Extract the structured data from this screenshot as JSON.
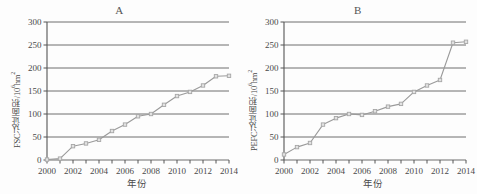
{
  "figure": {
    "panel_a_letter": "A",
    "panel_b_letter": "B",
    "line_color": "#9a9a9a",
    "marker_color": "#a6a6a6",
    "axis_color": "#555555",
    "gridline_color": "#6e6e6e",
    "background": "#fdfdfd"
  },
  "chart_data": [
    {
      "type": "line",
      "title": "A",
      "xlabel": "年份",
      "ylabel": "FSC认证面积/10⁶hm²",
      "ylabel_main": "FSC认证面积/10",
      "ylabel_exp": "6",
      "ylabel_unit": "hm",
      "ylabel_unit_exp": "2",
      "x": [
        2000,
        2001,
        2002,
        2003,
        2004,
        2005,
        2006,
        2007,
        2008,
        2009,
        2010,
        2011,
        2012,
        2013,
        2014
      ],
      "values": [
        1,
        3,
        30,
        36,
        44,
        63,
        77,
        95,
        100,
        120,
        139,
        148,
        162,
        182,
        183
      ],
      "xticklabels": [
        "2000",
        "2002",
        "2004",
        "2006",
        "2008",
        "2010",
        "2012",
        "2014"
      ],
      "yticklabels": [
        "0",
        "50",
        "100",
        "150",
        "200",
        "250",
        "300"
      ],
      "xlim": [
        2000,
        2014
      ],
      "ylim": [
        0,
        300
      ],
      "grid": true,
      "legend": null,
      "marker": "square"
    },
    {
      "type": "line",
      "title": "B",
      "xlabel": "年份",
      "ylabel": "PEFC认证面积/10⁶hm²",
      "ylabel_main": "PEFC认证面积/10",
      "ylabel_exp": "6",
      "ylabel_unit": "hm",
      "ylabel_unit_exp": "2",
      "x": [
        2000,
        2001,
        2002,
        2003,
        2004,
        2005,
        2006,
        2007,
        2008,
        2009,
        2010,
        2011,
        2012,
        2013,
        2014
      ],
      "values": [
        12,
        28,
        37,
        77,
        91,
        100,
        98,
        106,
        116,
        122,
        148,
        162,
        174,
        255,
        257
      ],
      "xticklabels": [
        "2000",
        "2002",
        "2004",
        "2006",
        "2008",
        "2010",
        "2012",
        "2014"
      ],
      "yticklabels": [
        "0",
        "50",
        "100",
        "150",
        "200",
        "250",
        "300"
      ],
      "xlim": [
        2000,
        2014
      ],
      "ylim": [
        0,
        300
      ],
      "grid": true,
      "legend": null,
      "marker": "square"
    }
  ]
}
